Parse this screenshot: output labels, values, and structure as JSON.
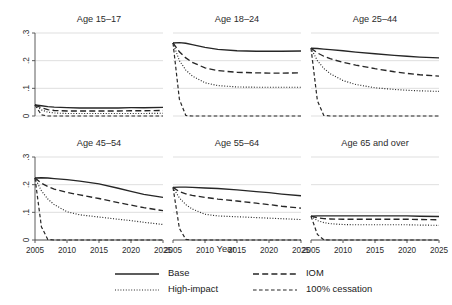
{
  "chart_data": {
    "type": "line",
    "title": "",
    "xlabel": "Year",
    "ylabel": "",
    "xlim": [
      2005,
      2025
    ],
    "ylim": [
      0,
      0.3
    ],
    "grid": true,
    "legend_position": "bottom",
    "x_ticks": [
      "2005",
      "2010",
      "2015",
      "2020",
      "2025"
    ],
    "x_tick_values": [
      2005,
      2010,
      2015,
      2020,
      2025
    ],
    "y_ticks": [
      "0",
      ".1",
      ".2",
      ".3"
    ],
    "y_tick_values": [
      0,
      0.1,
      0.2,
      0.3
    ],
    "x": [
      2005,
      2006,
      2007,
      2008,
      2010,
      2012,
      2015,
      2018,
      2020,
      2022,
      2025
    ],
    "legend": [
      {
        "name": "Base",
        "style": "solid"
      },
      {
        "name": "IOM",
        "style": "long-dash"
      },
      {
        "name": "High-impact",
        "style": "dotted"
      },
      {
        "name": "100% cessation",
        "style": "dashed"
      }
    ],
    "panels": [
      {
        "title": "Age 15–17",
        "series": [
          {
            "name": "Base",
            "values": [
              0.04,
              0.037,
              0.034,
              0.032,
              0.03,
              0.029,
              0.029,
              0.029,
              0.03,
              0.03,
              0.031
            ]
          },
          {
            "name": "IOM",
            "values": [
              0.04,
              0.03,
              0.023,
              0.02,
              0.018,
              0.018,
              0.018,
              0.018,
              0.019,
              0.019,
              0.02
            ]
          },
          {
            "name": "High-impact",
            "values": [
              0.04,
              0.022,
              0.014,
              0.011,
              0.009,
              0.009,
              0.009,
              0.009,
              0.009,
              0.009,
              0.01
            ]
          },
          {
            "name": "100% cessation",
            "values": [
              0.04,
              0.004,
              0.0,
              0.0,
              0.0,
              0.0,
              0.0,
              0.0,
              0.0,
              0.0,
              0.0
            ]
          }
        ]
      },
      {
        "title": "Age 18–24",
        "series": [
          {
            "name": "Base",
            "values": [
              0.264,
              0.265,
              0.263,
              0.258,
              0.248,
              0.241,
              0.236,
              0.234,
              0.234,
              0.234,
              0.235
            ]
          },
          {
            "name": "IOM",
            "values": [
              0.264,
              0.232,
              0.21,
              0.194,
              0.174,
              0.164,
              0.158,
              0.156,
              0.155,
              0.155,
              0.156
            ]
          },
          {
            "name": "High-impact",
            "values": [
              0.264,
              0.2,
              0.166,
              0.145,
              0.12,
              0.11,
              0.105,
              0.104,
              0.104,
              0.104,
              0.104
            ]
          },
          {
            "name": "100% cessation",
            "values": [
              0.264,
              0.06,
              0.002,
              0.0,
              0.0,
              0.0,
              0.0,
              0.0,
              0.0,
              0.0,
              0.0
            ]
          }
        ]
      },
      {
        "title": "Age 25–44",
        "series": [
          {
            "name": "Base",
            "values": [
              0.245,
              0.244,
              0.242,
              0.24,
              0.236,
              0.231,
              0.225,
              0.219,
              0.216,
              0.213,
              0.21
            ]
          },
          {
            "name": "IOM",
            "values": [
              0.245,
              0.228,
              0.216,
              0.207,
              0.194,
              0.184,
              0.171,
              0.16,
              0.154,
              0.149,
              0.144
            ]
          },
          {
            "name": "High-impact",
            "values": [
              0.245,
              0.2,
              0.172,
              0.153,
              0.128,
              0.114,
              0.102,
              0.096,
              0.093,
              0.091,
              0.089
            ]
          },
          {
            "name": "100% cessation",
            "values": [
              0.245,
              0.055,
              0.002,
              0.0,
              0.0,
              0.0,
              0.0,
              0.0,
              0.0,
              0.0,
              0.0
            ]
          }
        ]
      },
      {
        "title": "Age 45–54",
        "series": [
          {
            "name": "Base",
            "values": [
              0.224,
              0.225,
              0.224,
              0.222,
              0.218,
              0.213,
              0.203,
              0.187,
              0.176,
              0.165,
              0.154
            ]
          },
          {
            "name": "IOM",
            "values": [
              0.224,
              0.205,
              0.193,
              0.184,
              0.172,
              0.163,
              0.15,
              0.135,
              0.126,
              0.117,
              0.106
            ]
          },
          {
            "name": "High-impact",
            "values": [
              0.224,
              0.178,
              0.148,
              0.128,
              0.102,
              0.091,
              0.083,
              0.075,
              0.07,
              0.064,
              0.056
            ]
          },
          {
            "name": "100% cessation",
            "values": [
              0.224,
              0.048,
              0.002,
              0.0,
              0.0,
              0.0,
              0.0,
              0.0,
              0.0,
              0.0,
              0.0
            ]
          }
        ]
      },
      {
        "title": "Age 55–64",
        "series": [
          {
            "name": "Base",
            "values": [
              0.19,
              0.191,
              0.191,
              0.19,
              0.188,
              0.186,
              0.181,
              0.175,
              0.171,
              0.166,
              0.16
            ]
          },
          {
            "name": "IOM",
            "values": [
              0.19,
              0.175,
              0.167,
              0.161,
              0.154,
              0.148,
              0.141,
              0.133,
              0.128,
              0.122,
              0.115
            ]
          },
          {
            "name": "High-impact",
            "values": [
              0.19,
              0.152,
              0.128,
              0.112,
              0.093,
              0.087,
              0.084,
              0.081,
              0.079,
              0.077,
              0.074
            ]
          },
          {
            "name": "100% cessation",
            "values": [
              0.19,
              0.042,
              0.002,
              0.0,
              0.0,
              0.0,
              0.0,
              0.0,
              0.0,
              0.0,
              0.0
            ]
          }
        ]
      },
      {
        "title": "Age 65 and over",
        "series": [
          {
            "name": "Base",
            "values": [
              0.086,
              0.087,
              0.087,
              0.087,
              0.087,
              0.087,
              0.087,
              0.087,
              0.087,
              0.086,
              0.085
            ]
          },
          {
            "name": "IOM",
            "values": [
              0.086,
              0.08,
              0.077,
              0.076,
              0.075,
              0.075,
              0.075,
              0.075,
              0.075,
              0.074,
              0.073
            ]
          },
          {
            "name": "High-impact",
            "values": [
              0.086,
              0.07,
              0.063,
              0.059,
              0.056,
              0.055,
              0.055,
              0.055,
              0.055,
              0.054,
              0.053
            ]
          },
          {
            "name": "100% cessation",
            "values": [
              0.086,
              0.02,
              0.001,
              0.0,
              0.0,
              0.0,
              0.0,
              0.0,
              0.0,
              0.0,
              0.0
            ]
          }
        ]
      }
    ]
  }
}
